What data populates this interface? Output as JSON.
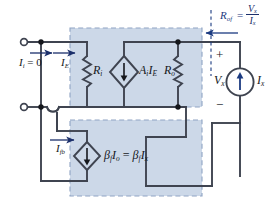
{
  "figure": {
    "type": "circuit-schematic",
    "colors": {
      "block_fill": "#ccd8e8",
      "block_border_dashed": "#8fa4c4",
      "wire": "#3f4450",
      "label_text": "#15171c",
      "annotation_text": "#1b3a80",
      "background": "#ffffff"
    }
  },
  "labels": {
    "input_current": {
      "symbol": "I",
      "sub": "i",
      "equals": "= 0",
      "full": "I i = 0"
    },
    "emitter_current": {
      "symbol": "I",
      "sub": "E",
      "full": "I E"
    },
    "feedback_current": {
      "symbol": "I",
      "sub": "fb",
      "full": "I fb"
    },
    "input_resistance": {
      "symbol": "R",
      "sub": "i",
      "full": "R i"
    },
    "output_resistance": {
      "symbol": "R",
      "sub": "o",
      "full": "R o"
    },
    "dependent_voltage_source": {
      "symbol": "A",
      "sub1": "i",
      "symbol2": "I",
      "sub2": "E",
      "full": "A i I E"
    },
    "dependent_current_source": {
      "full": "β f I o = β f I x"
    },
    "test_voltage": {
      "symbol": "V",
      "sub": "x",
      "full": "V x"
    },
    "test_current": {
      "symbol": "I",
      "sub": "x",
      "full": "I x"
    },
    "plus_sign": "+",
    "minus_sign": "−"
  },
  "annotation": {
    "name": "output-resistance-definition",
    "lhs": {
      "symbol": "R",
      "sub": "of"
    },
    "equals": "=",
    "numerator": {
      "symbol": "V",
      "sub": "x"
    },
    "denominator": {
      "symbol": "I",
      "sub": "x"
    },
    "full": "R of = V x / I x",
    "arrow_direction": "left"
  },
  "blocks": [
    {
      "name": "amplifier-block",
      "label": "forward amplifier (dashed)"
    },
    {
      "name": "feedback-block",
      "label": "feedback network (dashed)"
    }
  ],
  "terminals": [
    {
      "name": "input-terminal-top"
    },
    {
      "name": "input-terminal-bottom"
    }
  ]
}
